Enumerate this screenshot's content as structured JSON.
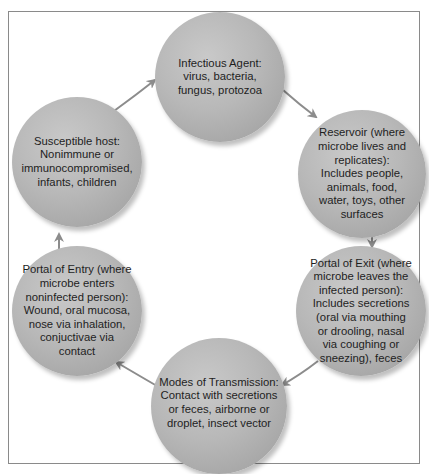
{
  "diagram": {
    "type": "cycle",
    "nodes": [
      {
        "id": "infectious-agent",
        "label": "Infectious Agent:\nvirus, bacteria,\nfungus, protozoa"
      },
      {
        "id": "reservoir",
        "label": "Reservoir (where\nmicrobe lives and\nreplicates):\nIncludes people,\nanimals, food,\nwater, toys, other\nsurfaces"
      },
      {
        "id": "portal-of-exit",
        "label": "Portal of Exit (where\nmicrobe leaves the\ninfected person):\nIncludes secretions\n(oral via mouthing\nor drooling, nasal\nvia coughing or\nsneezing), feces"
      },
      {
        "id": "modes-of-transmission",
        "label": "Modes of Transmission:\nContact with secretions\nor feces, airborne or\ndroplet, insect vector"
      },
      {
        "id": "portal-of-entry",
        "label": "Portal of Entry (where\nmicrobe enters\nnoninfected person):\nWound, oral mucosa,\nnose via inhalation,\nconjuctivae via\ncontact"
      },
      {
        "id": "susceptible-host",
        "label": "Susceptible host:\nNonimmune or\nimmunocompromised,\ninfants, children"
      }
    ],
    "edges": [
      {
        "from": "infectious-agent",
        "to": "reservoir"
      },
      {
        "from": "reservoir",
        "to": "portal-of-exit"
      },
      {
        "from": "portal-of-exit",
        "to": "modes-of-transmission"
      },
      {
        "from": "modes-of-transmission",
        "to": "portal-of-entry"
      },
      {
        "from": "portal-of-entry",
        "to": "susceptible-host"
      },
      {
        "from": "susceptible-host",
        "to": "infectious-agent"
      }
    ],
    "colors": {
      "node_fill": "#b8b8b8",
      "arrow": "#8c8c8c",
      "frame": "#8a8a8a",
      "text": "#1e1e1e"
    }
  }
}
